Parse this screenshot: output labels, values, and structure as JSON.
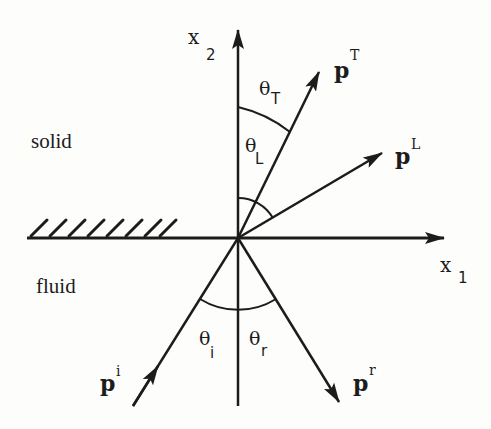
{
  "diagram": {
    "type": "wave reflection/refraction at fluid-solid interface",
    "colors": {
      "ink": "#1c1c1c",
      "background": "#fdfdfb"
    },
    "regions": {
      "upper": "solid",
      "lower": "fluid"
    },
    "axes": {
      "horizontal": {
        "name": "x",
        "sub": "1"
      },
      "vertical": {
        "name": "x",
        "sub": "2"
      }
    },
    "vectors": {
      "incident": {
        "name": "p",
        "sup": "i"
      },
      "reflected": {
        "name": "p",
        "sup": "r"
      },
      "transverse": {
        "name": "p",
        "sup": "T"
      },
      "longitudinal": {
        "name": "p",
        "sup": "L"
      }
    },
    "angles": {
      "incident": {
        "sym": "θ",
        "sub": "i"
      },
      "reflected": {
        "sym": "θ",
        "sub": "r"
      },
      "transverse": {
        "sym": "θ",
        "sub": "T"
      },
      "longitudinal": {
        "sym": "θ",
        "sub": "L"
      }
    }
  }
}
